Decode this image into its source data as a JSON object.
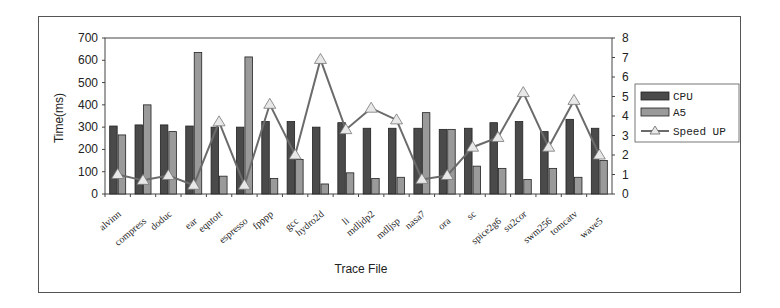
{
  "chart_data": {
    "type": "bar+line",
    "title": "",
    "xlabel": "Trace File",
    "ylabel": "Time(ms)",
    "y2label": "",
    "ylim": [
      0,
      700
    ],
    "y2lim": [
      0,
      8
    ],
    "yticks": [
      0,
      100,
      200,
      300,
      400,
      500,
      600,
      700
    ],
    "y2ticks": [
      0,
      1,
      2,
      3,
      4,
      5,
      6,
      7,
      8
    ],
    "grid": false,
    "legend_position": "right",
    "categories": [
      "alvinn",
      "compress",
      "doduc",
      "ear",
      "eqntott",
      "espresso",
      "fpppp",
      "gcc",
      "hydro2d",
      "li",
      "mdljdp2",
      "mdljsp",
      "nasa7",
      "ora",
      "sc",
      "spice2g6",
      "su2cor",
      "swm256",
      "tomcatv",
      "wave5"
    ],
    "series": [
      {
        "name": "CPU",
        "type": "bar",
        "axis": "left",
        "color": "#4a4a4a",
        "values": [
          305,
          310,
          310,
          305,
          300,
          300,
          325,
          325,
          300,
          320,
          295,
          295,
          295,
          290,
          295,
          320,
          325,
          280,
          335,
          295
        ]
      },
      {
        "name": "A5",
        "type": "bar",
        "axis": "left",
        "color": "#9a9a9a",
        "values": [
          265,
          400,
          280,
          635,
          80,
          615,
          70,
          155,
          45,
          95,
          70,
          75,
          365,
          290,
          125,
          115,
          65,
          115,
          75,
          150
        ]
      },
      {
        "name": "Speed UP",
        "type": "line",
        "axis": "right",
        "color": "#6b6b6b",
        "marker": "triangle",
        "values": [
          1.0,
          0.7,
          0.95,
          0.45,
          3.7,
          0.45,
          4.6,
          2.0,
          6.9,
          3.3,
          4.4,
          3.8,
          0.75,
          0.95,
          2.4,
          2.9,
          5.2,
          2.4,
          4.8,
          2.0
        ]
      }
    ]
  },
  "legend": {
    "items": [
      {
        "label": "CPU"
      },
      {
        "label": "A5"
      },
      {
        "label": "Speed UP"
      }
    ]
  },
  "axes": {
    "x_title": "Trace File",
    "y_title": "Time(ms)"
  }
}
